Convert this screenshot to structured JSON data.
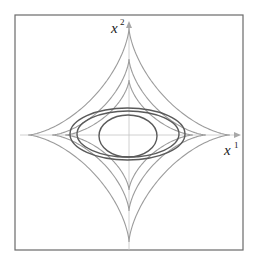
{
  "figure": {
    "frame": {
      "x": 15,
      "y": 15,
      "width": 228,
      "height": 235
    },
    "origin": {
      "x": 129,
      "y": 135
    },
    "axes": {
      "x": {
        "label": "x",
        "superscript": "1",
        "from": 20,
        "to": 241
      },
      "y": {
        "label": "x",
        "superscript": "2",
        "from": 250,
        "to": 21
      }
    },
    "astroids": [
      {
        "name": "outer",
        "rx": 101,
        "ry": 107
      },
      {
        "name": "middle",
        "rx": 77,
        "ry": 76
      },
      {
        "name": "inner",
        "rx": 64,
        "ry": 55
      }
    ],
    "ellipses": [
      {
        "name": "wide",
        "cx": 127.5,
        "cy": 134,
        "rx": 57.5,
        "ry": 26
      },
      {
        "name": "medium",
        "cx": 128,
        "cy": 134,
        "rx": 51,
        "ry": 23
      },
      {
        "name": "circle",
        "cx": 128,
        "cy": 136,
        "rx": 29,
        "ry": 21
      }
    ],
    "colors": {
      "astroid": "#9c9c9c",
      "ellipse": "#5a5a5a",
      "axis": "#c4c4c4",
      "frame": "#6a6a6a"
    }
  }
}
